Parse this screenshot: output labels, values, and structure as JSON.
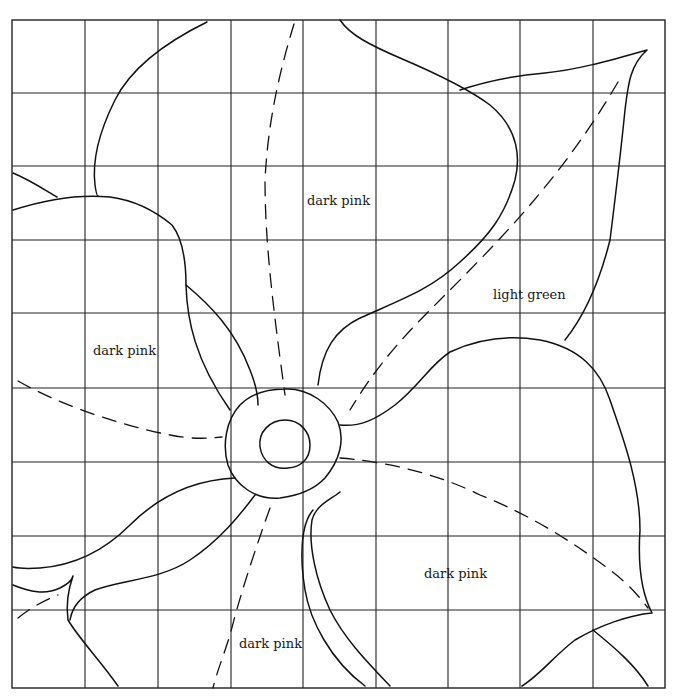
{
  "diagram": {
    "title": "",
    "type": "flower quilt/appliqué pattern on grid",
    "grid": {
      "columns": 9,
      "rows": 9,
      "x_lines": [
        12,
        85,
        158,
        231,
        303,
        376,
        448,
        520,
        593,
        665
      ],
      "y_lines": [
        20,
        93,
        166,
        240,
        313,
        388,
        462,
        536,
        610,
        688
      ]
    },
    "labels": [
      {
        "id": "top-petal",
        "text": "dark pink",
        "x": 307,
        "y": 193
      },
      {
        "id": "leaf",
        "text": "light green",
        "x": 493,
        "y": 287
      },
      {
        "id": "left-petal",
        "text": "dark pink",
        "x": 93,
        "y": 343
      },
      {
        "id": "right-petal",
        "text": "dark pink",
        "x": 424,
        "y": 566
      },
      {
        "id": "bottom-petal",
        "text": "dark pink",
        "x": 239,
        "y": 636
      }
    ],
    "colors": {
      "line": "#111111",
      "background": "#ffffff"
    }
  }
}
